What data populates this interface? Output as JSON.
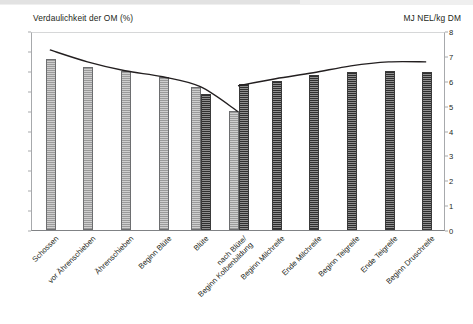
{
  "chart_data": {
    "type": "bar",
    "title": "",
    "left_axis": {
      "label": "Verdaulichkeit der OM (%)",
      "ticks": [
        0,
        10,
        20,
        30,
        40,
        50,
        60,
        70,
        80,
        90,
        100
      ],
      "ylim": [
        0,
        100
      ]
    },
    "right_axis": {
      "label": "MJ NEL/kg DM",
      "ticks": [
        0,
        1,
        2,
        3,
        4,
        5,
        6,
        7,
        8
      ],
      "ylim": [
        0,
        8
      ]
    },
    "categories": [
      "Schossen",
      "vor Ährenschieben",
      "Ährenschieben",
      "Beginn Blüte",
      "Blüte",
      "nach Blüte/",
      "Beginn Milchreife",
      "Ende Milchreife",
      "Beginn Teigreife",
      "Ende Teigreife",
      "Beginn Druschreife"
    ],
    "category_second_lines": [
      "",
      "",
      "",
      "",
      "",
      "Beginn Kolbenbildung",
      "",
      "",
      "",
      "",
      ""
    ],
    "series": [
      {
        "name": "Verdaulichkeit der OM (%) - hell",
        "axis": "left",
        "style": "light-hatched-bar",
        "values": [
          86,
          82,
          80,
          77,
          72,
          60,
          null,
          null,
          null,
          null,
          null
        ]
      },
      {
        "name": "MJ NEL/kg DM - dunkel",
        "axis": "right",
        "style": "dark-hatched-bar",
        "values": [
          null,
          null,
          null,
          null,
          5.45,
          5.85,
          6.0,
          6.25,
          6.35,
          6.4,
          6.35
        ]
      },
      {
        "name": "Kurve fallend",
        "axis": "left",
        "style": "line",
        "values": [
          91,
          85,
          80.5,
          77.5,
          72.5,
          60,
          null,
          null,
          null,
          null,
          null
        ]
      },
      {
        "name": "Kurve steigend",
        "axis": "left",
        "style": "line",
        "values": [
          null,
          null,
          null,
          null,
          null,
          73,
          76.5,
          79.5,
          83,
          85,
          85
        ]
      }
    ],
    "grid": false,
    "legend": "none"
  },
  "colors": {
    "bar_light": "#cfcfcf",
    "bar_dark": "#2f2f2f",
    "line": "#231f20",
    "axis": "#a7a9ac",
    "text": "#231f20"
  }
}
